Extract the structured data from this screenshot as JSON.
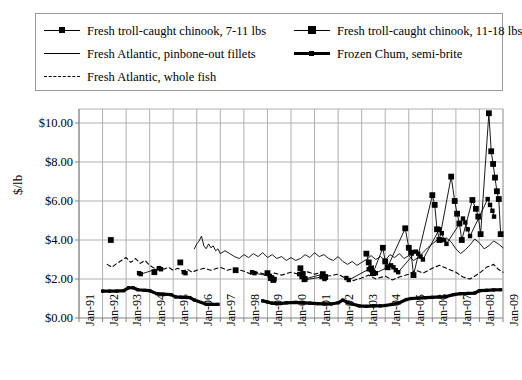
{
  "legend": {
    "rows": [
      [
        {
          "key": "line-small-square",
          "label": "Fresh troll-caught chinook, 7-11 lbs"
        },
        {
          "key": "line-big-square",
          "label": "Fresh troll-caught chinook, 11-18 lbs"
        }
      ],
      [
        {
          "key": "thin-line",
          "label": "Fresh Atlantic, pinbone-out fillets"
        },
        {
          "key": "thick-line-square",
          "label": "Frozen Chum, semi-brite"
        }
      ],
      [
        {
          "key": "dashed-line",
          "label": "Fresh Atlantic, whole fish"
        }
      ]
    ]
  },
  "chart_data": {
    "type": "line",
    "title": "",
    "xlabel": "",
    "ylabel": "$/lb",
    "ylim": [
      0,
      10
    ],
    "yticks": [
      0,
      2,
      4,
      6,
      8,
      10
    ],
    "ytick_labels": [
      "$0.00",
      "$2.00",
      "$4.00",
      "$6.00",
      "$8.00",
      "$10.00"
    ],
    "xtick_labels": [
      "Jan-91",
      "Jan-92",
      "Jan-93",
      "Jan-94",
      "Jan-95",
      "Jan-96",
      "Jan-97",
      "Jan-98",
      "Jan-99",
      "Jan-00",
      "Jan-01",
      "Jan-02",
      "Jan-03",
      "Jan-04",
      "Jan-05",
      "Jan-06",
      "Jan-07",
      "Jan-08",
      "Jan-09"
    ],
    "xlim": [
      1991.0,
      2009.0
    ],
    "grid": true,
    "legend_position": "top",
    "colors": {
      "all_series": "#000000",
      "gridline": "#b0b0b0",
      "axis": "#808080"
    },
    "series": [
      {
        "name": "Fresh troll-caught chinook, 7-11 lbs",
        "style": "line-small-square",
        "points": [
          [
            1993.55,
            2.3
          ],
          [
            1993.62,
            2.25
          ],
          [
            1994.4,
            2.55
          ],
          [
            1994.48,
            2.5
          ],
          [
            1995.45,
            2.35
          ],
          [
            1995.52,
            2.3
          ],
          [
            1998.35,
            2.35
          ],
          [
            1998.45,
            2.3
          ],
          [
            1999.1,
            2.15
          ],
          [
            1999.2,
            2.05
          ],
          [
            1999.3,
            2.0
          ],
          [
            2000.35,
            2.25
          ],
          [
            2000.45,
            2.1
          ],
          [
            2000.55,
            1.95
          ],
          [
            2001.3,
            2.1
          ],
          [
            2001.42,
            2.0
          ],
          [
            2002.35,
            2.05
          ],
          [
            2002.45,
            1.95
          ],
          [
            2003.3,
            2.5
          ],
          [
            2003.4,
            2.45
          ],
          [
            2003.5,
            2.35
          ],
          [
            2003.6,
            2.3
          ],
          [
            2004.25,
            2.7
          ],
          [
            2004.35,
            2.6
          ],
          [
            2004.45,
            2.45
          ],
          [
            2004.55,
            2.35
          ],
          [
            2005.3,
            3.4
          ],
          [
            2005.4,
            3.3
          ],
          [
            2005.5,
            3.15
          ],
          [
            2005.6,
            3.0
          ],
          [
            2006.3,
            4.55
          ],
          [
            2006.4,
            4.35
          ],
          [
            2006.5,
            4.0
          ],
          [
            2006.6,
            3.8
          ],
          [
            2007.3,
            5.1
          ],
          [
            2007.4,
            4.9
          ],
          [
            2007.5,
            4.55
          ],
          [
            2007.6,
            4.2
          ],
          [
            2008.35,
            6.1
          ],
          [
            2008.45,
            5.8
          ],
          [
            2008.55,
            5.5
          ],
          [
            2008.62,
            5.2
          ]
        ]
      },
      {
        "name": "Fresh troll-caught chinook, 11-18 lbs",
        "style": "line-big-square",
        "points": [
          [
            1992.35,
            4.0
          ],
          [
            1994.2,
            2.35
          ],
          [
            1995.3,
            2.85
          ],
          [
            1997.65,
            2.45
          ],
          [
            1999.0,
            2.3
          ],
          [
            1999.15,
            2.05
          ],
          [
            1999.25,
            1.95
          ],
          [
            2000.4,
            2.55
          ],
          [
            2000.5,
            2.25
          ],
          [
            2000.58,
            2.0
          ],
          [
            2001.35,
            2.25
          ],
          [
            2001.45,
            2.1
          ],
          [
            2003.2,
            3.3
          ],
          [
            2003.3,
            2.85
          ],
          [
            2003.4,
            2.55
          ],
          [
            2003.48,
            2.3
          ],
          [
            2003.9,
            3.6
          ],
          [
            2004.0,
            2.9
          ],
          [
            2004.1,
            2.6
          ],
          [
            2004.85,
            4.6
          ],
          [
            2005.0,
            3.6
          ],
          [
            2005.1,
            3.35
          ],
          [
            2005.2,
            2.2
          ],
          [
            2006.0,
            6.3
          ],
          [
            2006.1,
            5.8
          ],
          [
            2006.2,
            4.55
          ],
          [
            2006.3,
            4.0
          ],
          [
            2006.8,
            7.25
          ],
          [
            2006.95,
            6.0
          ],
          [
            2007.05,
            5.35
          ],
          [
            2007.15,
            4.85
          ],
          [
            2007.25,
            4.0
          ],
          [
            2007.7,
            6.05
          ],
          [
            2007.85,
            5.6
          ],
          [
            2007.95,
            5.2
          ],
          [
            2008.05,
            4.3
          ],
          [
            2008.4,
            10.5
          ],
          [
            2008.5,
            8.55
          ],
          [
            2008.58,
            7.9
          ],
          [
            2008.66,
            7.2
          ],
          [
            2008.74,
            6.5
          ],
          [
            2008.82,
            6.1
          ],
          [
            2008.9,
            4.3
          ]
        ]
      },
      {
        "name": "Fresh Atlantic, pinbone-out fillets",
        "style": "thin-line",
        "points": [
          [
            1995.9,
            3.55
          ],
          [
            1996.0,
            3.8
          ],
          [
            1996.1,
            3.95
          ],
          [
            1996.2,
            4.2
          ],
          [
            1996.3,
            3.7
          ],
          [
            1996.4,
            3.55
          ],
          [
            1996.5,
            3.8
          ],
          [
            1996.6,
            3.6
          ],
          [
            1996.7,
            3.7
          ],
          [
            1996.8,
            3.45
          ],
          [
            1996.9,
            3.55
          ],
          [
            1997.0,
            3.3
          ],
          [
            1997.2,
            3.45
          ],
          [
            1997.4,
            3.3
          ],
          [
            1997.6,
            3.15
          ],
          [
            1997.8,
            3.05
          ],
          [
            1998.0,
            3.25
          ],
          [
            1998.2,
            3.1
          ],
          [
            1998.4,
            3.3
          ],
          [
            1998.6,
            3.15
          ],
          [
            1998.8,
            3.35
          ],
          [
            1999.0,
            3.1
          ],
          [
            1999.2,
            3.25
          ],
          [
            1999.4,
            3.05
          ],
          [
            1999.6,
            3.15
          ],
          [
            1999.8,
            2.95
          ],
          [
            2000.0,
            3.1
          ],
          [
            2000.2,
            2.95
          ],
          [
            2000.4,
            3.05
          ],
          [
            2000.6,
            3.25
          ],
          [
            2000.8,
            3.1
          ],
          [
            2001.0,
            3.35
          ],
          [
            2001.2,
            3.15
          ],
          [
            2001.4,
            3.25
          ],
          [
            2001.6,
            3.05
          ],
          [
            2001.8,
            2.95
          ],
          [
            2002.0,
            3.15
          ],
          [
            2002.2,
            2.9
          ],
          [
            2002.4,
            2.75
          ],
          [
            2002.6,
            2.9
          ],
          [
            2002.8,
            2.7
          ],
          [
            2003.0,
            2.85
          ],
          [
            2003.2,
            3.0
          ],
          [
            2003.4,
            3.2
          ],
          [
            2003.6,
            3.0
          ],
          [
            2003.8,
            3.15
          ],
          [
            2004.0,
            2.95
          ],
          [
            2004.2,
            3.25
          ],
          [
            2004.4,
            3.1
          ],
          [
            2004.6,
            3.3
          ],
          [
            2004.8,
            3.05
          ],
          [
            2005.0,
            3.2
          ],
          [
            2005.2,
            2.95
          ],
          [
            2005.4,
            3.1
          ],
          [
            2005.6,
            3.35
          ],
          [
            2005.8,
            3.6
          ],
          [
            2006.0,
            3.8
          ],
          [
            2006.2,
            4.0
          ],
          [
            2006.4,
            3.9
          ],
          [
            2006.6,
            4.1
          ],
          [
            2006.8,
            3.9
          ],
          [
            2007.0,
            3.55
          ],
          [
            2007.2,
            3.3
          ],
          [
            2007.4,
            3.5
          ],
          [
            2007.6,
            3.75
          ],
          [
            2007.8,
            4.05
          ],
          [
            2008.0,
            3.85
          ],
          [
            2008.2,
            3.55
          ],
          [
            2008.4,
            3.7
          ],
          [
            2008.6,
            3.95
          ],
          [
            2008.8,
            3.8
          ],
          [
            2009.0,
            3.6
          ]
        ]
      },
      {
        "name": "Fresh Atlantic, whole fish",
        "style": "dashed-line",
        "points": [
          [
            1992.2,
            2.75
          ],
          [
            1992.4,
            2.6
          ],
          [
            1992.6,
            2.8
          ],
          [
            1992.8,
            2.95
          ],
          [
            1993.0,
            3.1
          ],
          [
            1993.2,
            2.85
          ],
          [
            1993.4,
            3.05
          ],
          [
            1993.6,
            2.8
          ],
          [
            1993.8,
            2.95
          ],
          [
            1994.0,
            2.7
          ],
          [
            1994.2,
            2.55
          ],
          [
            1994.4,
            2.65
          ],
          [
            1994.6,
            2.5
          ],
          [
            1994.8,
            2.6
          ],
          [
            1995.0,
            2.45
          ],
          [
            1995.2,
            2.55
          ],
          [
            1995.4,
            2.4
          ],
          [
            1995.6,
            2.5
          ],
          [
            1995.8,
            2.35
          ],
          [
            1996.0,
            2.45
          ],
          [
            1996.3,
            2.55
          ],
          [
            1996.6,
            2.45
          ],
          [
            1997.0,
            2.6
          ],
          [
            1997.3,
            2.45
          ],
          [
            1997.6,
            2.55
          ],
          [
            1998.0,
            2.4
          ],
          [
            1998.3,
            2.25
          ],
          [
            1998.6,
            2.35
          ],
          [
            1999.0,
            2.2
          ],
          [
            1999.3,
            2.3
          ],
          [
            1999.6,
            2.2
          ],
          [
            2000.0,
            2.35
          ],
          [
            2000.3,
            2.25
          ],
          [
            2000.6,
            2.4
          ],
          [
            2001.0,
            2.25
          ],
          [
            2001.3,
            2.35
          ],
          [
            2001.6,
            2.15
          ],
          [
            2002.0,
            2.25
          ],
          [
            2002.3,
            2.05
          ],
          [
            2002.6,
            1.9
          ],
          [
            2003.0,
            2.05
          ],
          [
            2003.3,
            2.2
          ],
          [
            2003.6,
            2.0
          ],
          [
            2004.0,
            2.15
          ],
          [
            2004.3,
            1.95
          ],
          [
            2004.6,
            2.1
          ],
          [
            2005.0,
            2.25
          ],
          [
            2005.3,
            2.45
          ],
          [
            2005.6,
            2.3
          ],
          [
            2006.0,
            2.55
          ],
          [
            2006.3,
            2.7
          ],
          [
            2006.6,
            2.55
          ],
          [
            2007.0,
            2.35
          ],
          [
            2007.3,
            2.1
          ],
          [
            2007.6,
            2.0
          ],
          [
            2008.0,
            2.3
          ],
          [
            2008.3,
            2.6
          ],
          [
            2008.6,
            2.75
          ],
          [
            2008.8,
            2.5
          ],
          [
            2009.0,
            2.35
          ]
        ]
      },
      {
        "name": "Frozen Chum, semi-brite",
        "style": "thick-line-square",
        "points": [
          [
            1992.0,
            1.38
          ],
          [
            1992.3,
            1.38
          ],
          [
            1992.6,
            1.38
          ],
          [
            1992.9,
            1.4
          ],
          [
            1993.1,
            1.55
          ],
          [
            1993.3,
            1.55
          ],
          [
            1993.5,
            1.45
          ],
          [
            1993.8,
            1.42
          ],
          [
            1994.0,
            1.4
          ],
          [
            1994.3,
            1.25
          ],
          [
            1994.6,
            1.22
          ],
          [
            1994.9,
            1.2
          ],
          [
            1995.1,
            1.08
          ],
          [
            1995.4,
            1.06
          ],
          [
            1995.7,
            1.05
          ],
          [
            1995.9,
            0.92
          ],
          [
            1996.4,
            0.7
          ],
          [
            1996.6,
            0.7
          ],
          [
            1996.9,
            0.7
          ],
          [
            1998.8,
            0.88
          ],
          [
            1999.0,
            0.82
          ],
          [
            1999.2,
            0.76
          ],
          [
            1999.5,
            0.74
          ],
          [
            1999.8,
            0.78
          ],
          [
            2000.2,
            0.8
          ],
          [
            2000.5,
            0.78
          ],
          [
            2000.8,
            0.76
          ],
          [
            2001.1,
            0.74
          ],
          [
            2001.4,
            0.72
          ],
          [
            2001.7,
            0.72
          ],
          [
            2002.0,
            0.78
          ],
          [
            2002.2,
            0.92
          ],
          [
            2002.4,
            0.8
          ],
          [
            2002.6,
            0.72
          ],
          [
            2002.9,
            0.62
          ],
          [
            2003.2,
            0.6
          ],
          [
            2003.5,
            0.62
          ],
          [
            2003.8,
            0.62
          ],
          [
            2004.0,
            0.64
          ],
          [
            2004.3,
            0.7
          ],
          [
            2004.6,
            0.78
          ],
          [
            2004.9,
            0.95
          ],
          [
            2005.1,
            1.0
          ],
          [
            2005.4,
            1.02
          ],
          [
            2005.7,
            1.04
          ],
          [
            2006.0,
            1.06
          ],
          [
            2006.3,
            1.08
          ],
          [
            2006.6,
            1.1
          ],
          [
            2006.9,
            1.2
          ],
          [
            2007.2,
            1.25
          ],
          [
            2007.5,
            1.26
          ],
          [
            2007.8,
            1.28
          ],
          [
            2008.0,
            1.4
          ],
          [
            2008.3,
            1.42
          ],
          [
            2008.6,
            1.44
          ],
          [
            2008.9,
            1.45
          ]
        ]
      }
    ]
  }
}
